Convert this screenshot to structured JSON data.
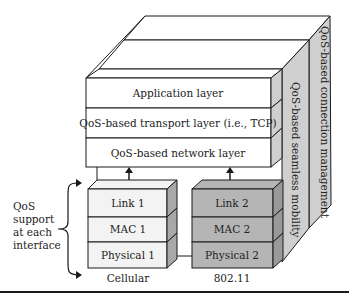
{
  "diagram": {
    "upper_stack": {
      "layers": [
        {
          "label": "Application layer"
        },
        {
          "label": "QoS-based transport layer (i.e., TCP)"
        },
        {
          "label": "QoS-based network layer"
        }
      ]
    },
    "side_panels": [
      {
        "label": "QoS-based seamless mobility"
      },
      {
        "label": "QoS-based connection management"
      }
    ],
    "interfaces": [
      {
        "name": "Cellular",
        "layers": [
          {
            "label": "Link 1"
          },
          {
            "label": "MAC 1"
          },
          {
            "label": "Physical 1"
          }
        ],
        "fill": "#f2f2f2"
      },
      {
        "name": "802.11",
        "layers": [
          {
            "label": "Link 2"
          },
          {
            "label": "MAC 2"
          },
          {
            "label": "Physical 2"
          }
        ],
        "fill": "#b8b8b8"
      }
    ],
    "annotation": {
      "lines": [
        "QoS",
        "support",
        "at each",
        "interface"
      ]
    },
    "colors": {
      "stroke": "#1a1a1a",
      "white": "#ffffff",
      "side_gray": "#cfcfcf",
      "dark_box": "#b5b5b5",
      "dark_side": "#999999",
      "light_box": "#f3f3f3"
    }
  }
}
